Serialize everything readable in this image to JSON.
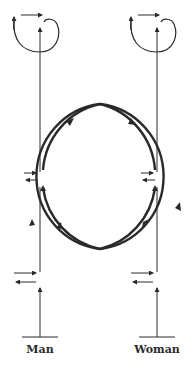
{
  "diagram": {
    "type": "interaction-loop",
    "colors": {
      "stroke": "#2a2a2a",
      "background": "#ffffff"
    },
    "participants": [
      {
        "id": "man",
        "label": "Man",
        "x": 40
      },
      {
        "id": "woman",
        "label": "Woman",
        "x": 157
      }
    ],
    "elements": [
      "self-feedback loop (top, each participant)",
      "two overlapping circular arcs with directional arrows",
      "bidirectional exchange arrows at mid level",
      "bidirectional exchange arrows at bottom level",
      "input arrow from baseline"
    ]
  }
}
